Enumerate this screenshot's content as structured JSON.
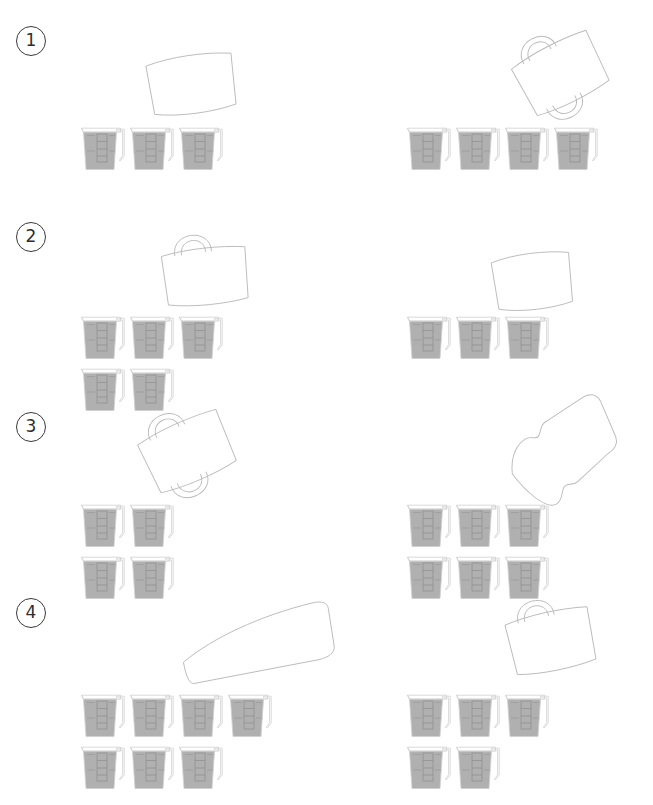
{
  "page": {
    "background": "#ffffff",
    "width": 653,
    "height": 805,
    "outline_color": "#b9b9b9",
    "cup_fill_color": "#b0b0b0",
    "cup_outline_color": "#cfcfcf",
    "badge_color": "#3a3a3a"
  },
  "rows": [
    {
      "number": "①",
      "badge_label": "1",
      "badge": {
        "x": 16,
        "y": 26
      },
      "panels": [
        {
          "name": "left",
          "container": {
            "type": "box-no-handle",
            "label": "rounded rectangle container",
            "x": 148,
            "y": 58,
            "w": 86,
            "h": 52,
            "rotate": -8,
            "handle_top": false,
            "handle_bottom": false
          },
          "cup_count": 3,
          "cup_rows": [
            3
          ],
          "cups_origin": {
            "x": 80,
            "y": 126
          }
        },
        {
          "name": "right",
          "container": {
            "type": "mug-two-handles",
            "label": "mug with handles",
            "x": 516,
            "y": 46,
            "w": 84,
            "h": 56,
            "rotate": -27,
            "handle_top": true,
            "handle_bottom": true
          },
          "cup_count": 4,
          "cup_rows": [
            4
          ],
          "cups_origin": {
            "x": 406,
            "y": 126
          }
        }
      ]
    },
    {
      "number": "②",
      "badge_label": "2",
      "badge": {
        "x": 16,
        "y": 222
      },
      "panels": [
        {
          "name": "left",
          "container": {
            "type": "mug-one-handle",
            "label": "mug with top handle",
            "x": 163,
            "y": 250,
            "w": 84,
            "h": 52,
            "rotate": -6,
            "handle_top": true,
            "handle_bottom": false
          },
          "cup_count": 5,
          "cup_rows": [
            3,
            2
          ],
          "cups_origin": {
            "x": 80,
            "y": 315
          }
        },
        {
          "name": "right",
          "container": {
            "type": "box-no-handle",
            "label": "rounded rectangle container",
            "x": 493,
            "y": 256,
            "w": 78,
            "h": 50,
            "rotate": -7,
            "handle_top": false,
            "handle_bottom": false
          },
          "cup_count": 3,
          "cup_rows": [
            3
          ],
          "cups_origin": {
            "x": 406,
            "y": 315
          }
        }
      ]
    },
    {
      "number": "③",
      "badge_label": "3",
      "badge": {
        "x": 16,
        "y": 412
      },
      "panels": [
        {
          "name": "left",
          "container": {
            "type": "mug-two-handles",
            "label": "mug with handles",
            "x": 142,
            "y": 424,
            "w": 86,
            "h": 56,
            "rotate": -24,
            "handle_top": true,
            "handle_bottom": true
          },
          "cup_count": 4,
          "cup_rows": [
            2,
            2
          ],
          "cups_origin": {
            "x": 80,
            "y": 503
          }
        },
        {
          "name": "right",
          "container": {
            "type": "bottle",
            "label": "bottle outline",
            "x": 506,
            "y": 413,
            "w": 112,
            "h": 82,
            "rotate": -28,
            "handle_top": false,
            "handle_bottom": false
          },
          "cup_count": 6,
          "cup_rows": [
            3,
            3
          ],
          "cups_origin": {
            "x": 406,
            "y": 503
          }
        }
      ]
    },
    {
      "number": "④",
      "badge_label": "4",
      "badge": {
        "x": 16,
        "y": 598
      },
      "panels": [
        {
          "name": "left",
          "container": {
            "type": "tapered-box",
            "label": "tapered container",
            "x": 180,
            "y": 612,
            "w": 152,
            "h": 60,
            "rotate": -10,
            "handle_top": false,
            "handle_bottom": false
          },
          "cup_count": 7,
          "cup_rows": [
            4,
            3
          ],
          "cups_origin": {
            "x": 80,
            "y": 693
          }
        },
        {
          "name": "right",
          "container": {
            "type": "mug-one-handle",
            "label": "mug with top handle",
            "x": 508,
            "y": 614,
            "w": 84,
            "h": 54,
            "rotate": -12,
            "handle_top": true,
            "handle_bottom": false
          },
          "cup_count": 5,
          "cup_rows": [
            3,
            2
          ],
          "cups_origin": {
            "x": 406,
            "y": 693
          }
        }
      ]
    }
  ],
  "cup": {
    "label": "measuring pitcher",
    "width": 48,
    "height": 46,
    "fill_level": "full",
    "gradation_marks": 3,
    "has_spout": true,
    "has_handle": true
  }
}
